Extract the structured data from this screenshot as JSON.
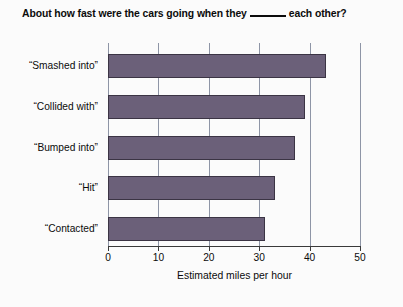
{
  "chart_data": {
    "type": "bar",
    "orientation": "horizontal",
    "title_prefix": "About how fast were the cars going when they",
    "title_suffix": "each other?",
    "xlabel": "Estimated miles per hour",
    "ylabel": "",
    "xlim": [
      0,
      50
    ],
    "xticks": [
      0,
      10,
      20,
      30,
      40,
      50
    ],
    "xtick_labels": [
      "0",
      "10",
      "20",
      "30",
      "40",
      "50"
    ],
    "grid": "vertical",
    "legend": "none",
    "bar_color": "#6b6079",
    "bar_edge_color": "#3b3444",
    "gridline_color": "#8e95a6",
    "axis_color": "#3a3a3a",
    "background_color": "#fbfbfb",
    "categories": [
      "“Smashed into”",
      "“Collided with”",
      "“Bumped into”",
      "“Hit”",
      "“Contacted”"
    ],
    "values": [
      43.3,
      39.1,
      37.1,
      33.2,
      31.1
    ]
  }
}
